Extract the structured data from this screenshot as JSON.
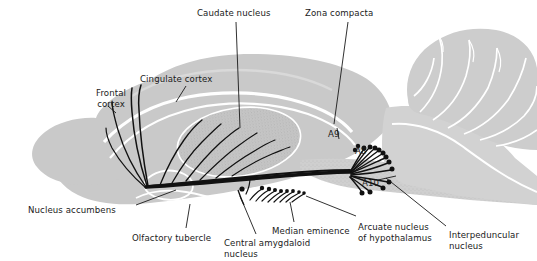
{
  "figure": {
    "colors": {
      "background": "#ffffff",
      "brain_fill": "#c9c9c9",
      "brain_fill_light": "#d5d5d5",
      "nucleus_fill": "#bdbdbd",
      "fissure": "#ffffff",
      "fiber": "#111111",
      "leader": "#1a1a1a",
      "text": "#1a1a1a"
    }
  },
  "labels": [
    {
      "id": "caudate-nucleus",
      "text": "Caudate nucleus",
      "x": 197,
      "y": 8,
      "align": "left"
    },
    {
      "id": "zona-compacta",
      "text": "Zona compacta",
      "x": 305,
      "y": 8,
      "align": "left"
    },
    {
      "id": "cingulate-cortex",
      "text": "Cingulate cortex",
      "x": 140,
      "y": 74,
      "align": "left"
    },
    {
      "id": "frontal-cortex",
      "text": "Frontal\ncortex",
      "x": 96,
      "y": 88,
      "align": "left"
    },
    {
      "id": "a9",
      "text": "A9",
      "x": 328,
      "y": 129,
      "align": "left"
    },
    {
      "id": "a8",
      "text": "A8",
      "x": 355,
      "y": 146,
      "align": "left"
    },
    {
      "id": "a10",
      "text": "A10",
      "x": 362,
      "y": 178,
      "align": "left"
    },
    {
      "id": "nucleus-accumbens",
      "text": "Nucleus accumbens",
      "x": 28,
      "y": 205,
      "align": "left"
    },
    {
      "id": "olfactory-tubercle",
      "text": "Olfactory tubercle",
      "x": 132,
      "y": 233,
      "align": "left"
    },
    {
      "id": "central-amygdaloid",
      "text": "Central amygdaloid\nnucleus",
      "x": 224,
      "y": 238,
      "align": "left"
    },
    {
      "id": "median-eminence",
      "text": "Median eminence",
      "x": 272,
      "y": 226,
      "align": "left"
    },
    {
      "id": "arcuate-nucleus",
      "text": "Arcuate nucleus\nof hypothalamus",
      "x": 358,
      "y": 222,
      "align": "left"
    },
    {
      "id": "interpeduncular",
      "text": "Interpeduncular\nnucleus",
      "x": 449,
      "y": 230,
      "align": "left"
    }
  ],
  "cell_groups": [
    {
      "name": "A8",
      "description": "dopaminergic cell group, retrorubral field"
    },
    {
      "name": "A9",
      "description": "dopaminergic cell group, substantia nigra zona compacta"
    },
    {
      "name": "A10",
      "description": "dopaminergic cell group, ventral tegmental area"
    }
  ],
  "regions": [
    "Frontal cortex",
    "Cingulate cortex",
    "Caudate nucleus",
    "Zona compacta",
    "Nucleus accumbens",
    "Olfactory tubercle",
    "Central amygdaloid nucleus",
    "Median eminence",
    "Arcuate nucleus of hypothalamus",
    "Interpeduncular nucleus"
  ]
}
